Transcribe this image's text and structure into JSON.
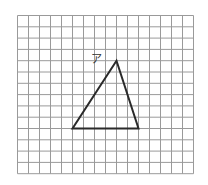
{
  "diagram": {
    "grid": {
      "columns": 16,
      "rows": 14,
      "origin_x": 17.5,
      "origin_y": 15.5,
      "cell_w": 11,
      "cell_h": 11.3,
      "line_color": "#9a9a9a"
    },
    "triangle": {
      "vertices_grid": [
        [
          9,
          4
        ],
        [
          5,
          10
        ],
        [
          11,
          10
        ]
      ],
      "stroke_color": "#2a2a2a"
    },
    "labels": [
      {
        "text": "ア",
        "attached_to": "apex",
        "x": 91,
        "y": 63
      }
    ]
  }
}
